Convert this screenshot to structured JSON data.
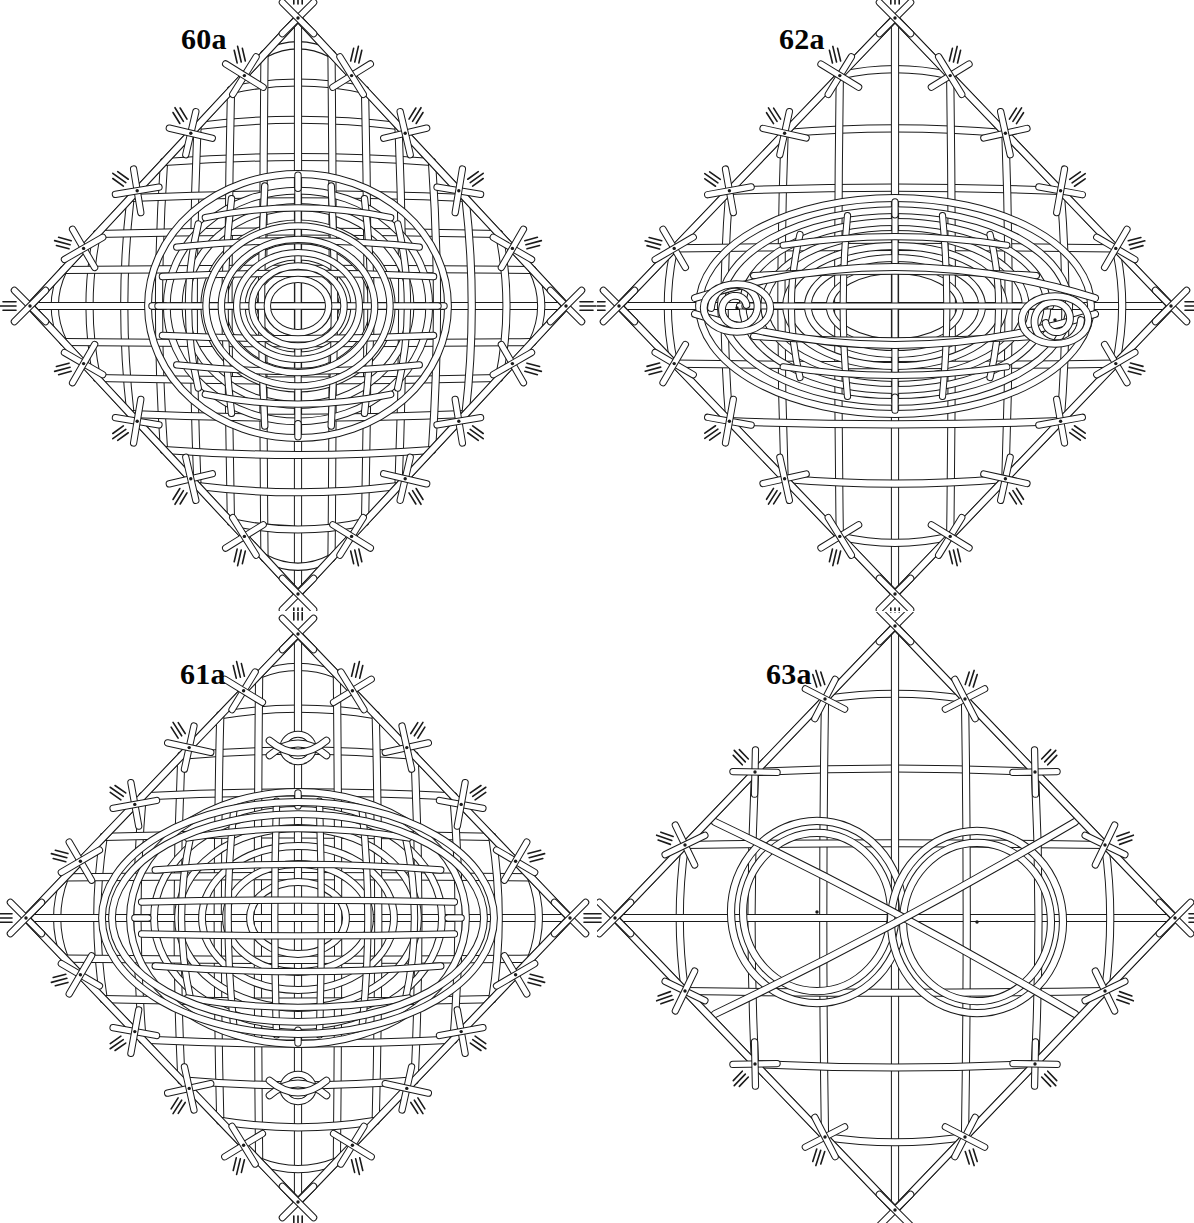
{
  "plate": {
    "title": "Plate of four interlaced knot diagrams",
    "background_color": "#ffffff",
    "ink_color": "#1a1a1a",
    "cord_fill_color": "#ffffff",
    "columns": 2,
    "rows": 2,
    "figure_count": 4
  },
  "figures": [
    {
      "id": "60a",
      "label": "60a",
      "label_position": "top-left",
      "grid_cell": "row1-col1",
      "outline_shape": "diamond",
      "core": "dense concentric elliptical weave",
      "density": "dense",
      "border_nodes": 20,
      "node_dots": true,
      "fringe_stubs": true,
      "rings": 0
    },
    {
      "id": "61a",
      "label": "61a",
      "label_position": "top-left",
      "grid_cell": "row2-col1",
      "outline_shape": "diamond",
      "core": "oval weave with tight knot loops at top and bottom centre",
      "density": "dense",
      "border_nodes": 20,
      "node_dots": true,
      "fringe_stubs": true,
      "rings": 0,
      "pinch_loops": 2
    },
    {
      "id": "62a",
      "label": "62a",
      "label_position": "top-left",
      "grid_cell": "row1-col2",
      "outline_shape": "diamond",
      "core": "horizontal lens weave with left and right spiral eye loops",
      "density": "open lattice with dense centre",
      "border_nodes": 20,
      "node_dots": true,
      "fringe_stubs": true,
      "rings": 0,
      "eye_spirals": 2
    },
    {
      "id": "63a",
      "label": "63a",
      "label_position": "top-left",
      "grid_cell": "row2-col2",
      "outline_shape": "diamond",
      "core": "two large open circular rings side by side",
      "density": "open lattice",
      "border_nodes": 20,
      "node_dots": true,
      "fringe_stubs": true,
      "rings": 2
    }
  ],
  "icons": {
    "knot_node": "node-knot-icon",
    "fringe": "cord-end-fringe-icon",
    "dot": "node-centre-dot-icon"
  }
}
